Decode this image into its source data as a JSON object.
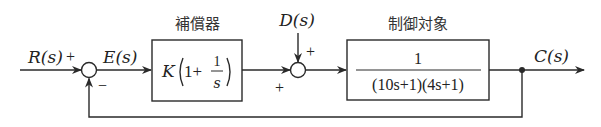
{
  "diagram": {
    "type": "feedback-control-block-diagram",
    "signals": {
      "reference": "R(s)",
      "error": "E(s)",
      "disturbance": "D(s)",
      "output": "C(s)"
    },
    "signs": {
      "sum1_input": "+",
      "sum1_feedback": "−",
      "sum2_disturbance": "+",
      "sum2_controller": "+"
    },
    "blocks": [
      {
        "title": "補償器",
        "expr_K": "K",
        "expr_one": "1+",
        "expr_num": "1",
        "expr_den": "s"
      },
      {
        "title": "制御対象",
        "numerator": "1",
        "denominator": "(10s+1)(4s+1)"
      }
    ]
  }
}
